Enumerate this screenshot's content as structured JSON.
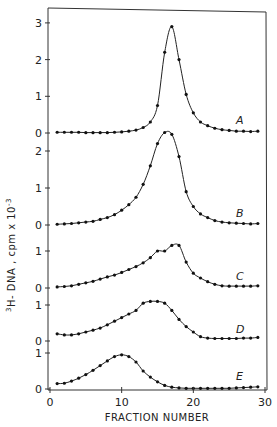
{
  "chart_data": {
    "type": "line",
    "title": "",
    "xlabel": "FRACTION NUMBER",
    "ylabel": "3H-DNA, cpm x 10^-3",
    "ylabel_parts": {
      "superscript_prefix": "3",
      "main": "H- DNA , cpm x 10",
      "exponent": "-3"
    },
    "xlim": [
      0,
      30
    ],
    "x_ticks": [
      0,
      10,
      20,
      30
    ],
    "x_tick_labels": [
      "0",
      "10",
      "20",
      "30"
    ],
    "grid": false,
    "legend": "none (panels labeled A–E inline)",
    "layout": "5 vertically stacked panels sharing x-axis",
    "x": [
      1,
      2,
      3,
      4,
      5,
      6,
      7,
      8,
      9,
      10,
      11,
      12,
      13,
      14,
      15,
      16,
      17,
      18,
      19,
      20,
      21,
      22,
      23,
      24,
      25,
      26,
      27,
      28,
      29
    ],
    "series": [
      {
        "name": "A",
        "y_ticks": [
          0,
          1,
          2,
          3
        ],
        "ylim": [
          0,
          3.3
        ],
        "values": [
          0.02,
          0.02,
          0.02,
          0.02,
          0.01,
          0.01,
          0.01,
          0.01,
          0.02,
          0.03,
          0.05,
          0.08,
          0.15,
          0.3,
          0.75,
          2.2,
          2.9,
          2.0,
          1.05,
          0.55,
          0.3,
          0.2,
          0.13,
          0.09,
          0.07,
          0.05,
          0.05,
          0.04,
          0.05
        ]
      },
      {
        "name": "B",
        "y_ticks": [
          0,
          1,
          2
        ],
        "ylim": [
          0,
          2.6
        ],
        "values": [
          0.02,
          0.03,
          0.04,
          0.06,
          0.08,
          0.1,
          0.15,
          0.2,
          0.28,
          0.4,
          0.55,
          0.75,
          1.1,
          1.6,
          2.2,
          2.5,
          2.45,
          1.85,
          0.9,
          0.5,
          0.3,
          0.2,
          0.12,
          0.08,
          0.06,
          0.05,
          0.04,
          0.03,
          0.04
        ]
      },
      {
        "name": "C",
        "y_ticks": [
          0,
          1
        ],
        "ylim": [
          0,
          1.25
        ],
        "values": [
          0.03,
          0.04,
          0.06,
          0.1,
          0.14,
          0.18,
          0.24,
          0.3,
          0.35,
          0.42,
          0.5,
          0.58,
          0.68,
          0.82,
          1.0,
          1.0,
          1.15,
          1.15,
          0.7,
          0.4,
          0.27,
          0.17,
          0.1,
          0.06,
          0.05,
          0.05,
          0.05,
          0.05,
          0.06
        ]
      },
      {
        "name": "D",
        "y_ticks": [
          0,
          1
        ],
        "ylim": [
          0,
          1.25
        ],
        "values": [
          0.2,
          0.17,
          0.17,
          0.2,
          0.25,
          0.3,
          0.36,
          0.45,
          0.55,
          0.65,
          0.75,
          0.85,
          1.05,
          1.1,
          1.1,
          1.05,
          0.85,
          0.6,
          0.4,
          0.25,
          0.12,
          0.08,
          0.07,
          0.07,
          0.07,
          0.07,
          0.08,
          0.08,
          0.1
        ]
      },
      {
        "name": "E",
        "y_ticks": [
          0,
          1
        ],
        "ylim": [
          0,
          1.2
        ],
        "values": [
          0.15,
          0.16,
          0.22,
          0.3,
          0.4,
          0.52,
          0.65,
          0.78,
          0.9,
          0.95,
          0.9,
          0.75,
          0.5,
          0.33,
          0.2,
          0.1,
          0.05,
          0.03,
          0.02,
          0.02,
          0.02,
          0.02,
          0.02,
          0.02,
          0.02,
          0.03,
          0.04,
          0.05,
          0.06
        ]
      }
    ]
  }
}
